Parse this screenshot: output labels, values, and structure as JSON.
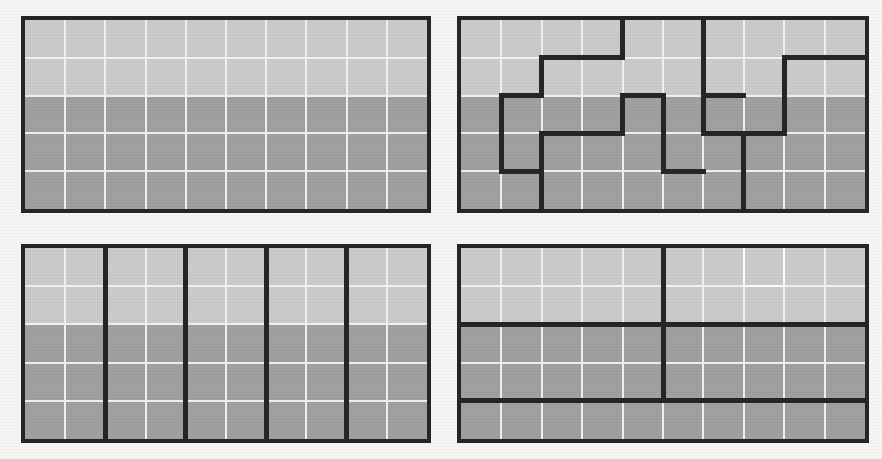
{
  "figure": {
    "background_color": "#f6f5f3",
    "panel_count": 4,
    "grid_columns": 10,
    "grid_rows": 5,
    "cell_size_px": 40,
    "colors": {
      "light_fill": "#cdcdcd",
      "dark_fill": "#a2a2a2",
      "gridline": "#f3f3f1",
      "gridline_bright": "#ffffff",
      "border": "#26262a",
      "thick_line": "#26262a"
    },
    "shading_rule": {
      "light_rows": [
        0,
        1
      ],
      "dark_rows": [
        2,
        3,
        4
      ]
    }
  },
  "panels": [
    {
      "id": "panel-top-left",
      "label": "Top left panel",
      "position": {
        "left": 21,
        "top": 16,
        "width": 410,
        "height": 197
      },
      "description": "Plain 10 by 5 grid with no thick partition lines",
      "thick_segments": [],
      "bright_cells": []
    },
    {
      "id": "panel-top-right",
      "label": "Top right panel",
      "position": {
        "left": 457,
        "top": 16,
        "width": 412,
        "height": 197
      },
      "description": "10 by 5 grid split by an irregular staircase partition",
      "thick_segments": [
        {
          "orient": "v",
          "x": 4,
          "y0": 0,
          "y1": 1
        },
        {
          "orient": "h",
          "y": 1,
          "x0": 2,
          "x1": 4
        },
        {
          "orient": "v",
          "x": 2,
          "y0": 1,
          "y1": 2
        },
        {
          "orient": "h",
          "y": 2,
          "x0": 1,
          "x1": 2
        },
        {
          "orient": "v",
          "x": 1,
          "y0": 2,
          "y1": 4
        },
        {
          "orient": "h",
          "y": 4,
          "x0": 1,
          "x1": 2
        },
        {
          "orient": "v",
          "x": 2,
          "y0": 3,
          "y1": 5
        },
        {
          "orient": "h",
          "y": 3,
          "x0": 2,
          "x1": 4
        },
        {
          "orient": "v",
          "x": 4,
          "y0": 2,
          "y1": 3
        },
        {
          "orient": "h",
          "y": 2,
          "x0": 4,
          "x1": 5
        },
        {
          "orient": "v",
          "x": 5,
          "y0": 2,
          "y1": 4
        },
        {
          "orient": "h",
          "y": 4,
          "x0": 5,
          "x1": 6
        },
        {
          "orient": "v",
          "x": 6,
          "y0": 0,
          "y1": 3
        },
        {
          "orient": "h",
          "y": 3,
          "x0": 6,
          "x1": 7
        },
        {
          "orient": "v",
          "x": 7,
          "y0": 3,
          "y1": 5
        },
        {
          "orient": "h",
          "y": 2,
          "x0": 6,
          "x1": 7
        },
        {
          "orient": "v",
          "x": 8,
          "y0": 1,
          "y1": 3
        },
        {
          "orient": "h",
          "y": 3,
          "x0": 7,
          "x1": 8
        },
        {
          "orient": "h",
          "y": 1,
          "x0": 8,
          "x1": 10
        }
      ],
      "bright_cells": []
    },
    {
      "id": "panel-bottom-left",
      "label": "Bottom left panel",
      "position": {
        "left": 21,
        "top": 244,
        "width": 410,
        "height": 199
      },
      "description": "10 by 5 grid split into five vertical strips two columns wide",
      "thick_segments": [
        {
          "orient": "v",
          "x": 2,
          "y0": 0,
          "y1": 5
        },
        {
          "orient": "v",
          "x": 4,
          "y0": 0,
          "y1": 5
        },
        {
          "orient": "v",
          "x": 6,
          "y0": 0,
          "y1": 5
        },
        {
          "orient": "v",
          "x": 8,
          "y0": 0,
          "y1": 5
        }
      ],
      "bright_cells": []
    },
    {
      "id": "panel-bottom-right",
      "label": "Bottom right panel",
      "position": {
        "left": 457,
        "top": 244,
        "width": 412,
        "height": 199
      },
      "description": "10 by 5 grid split by two full horizontal lines and one partial vertical line",
      "thick_segments": [
        {
          "orient": "h",
          "y": 2,
          "x0": 0,
          "x1": 10
        },
        {
          "orient": "h",
          "y": 4,
          "x0": 0,
          "x1": 10
        },
        {
          "orient": "v",
          "x": 5,
          "y0": 0,
          "y1": 4
        }
      ],
      "bright_cells": [
        {
          "x": 7,
          "y": 0
        }
      ]
    }
  ]
}
